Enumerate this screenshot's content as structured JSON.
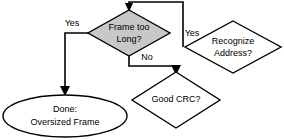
{
  "diagram": {
    "type": "flowchart",
    "canvas": {
      "width": 284,
      "height": 140,
      "background": "#ffffff"
    },
    "colors": {
      "stroke": "#000000",
      "fill_highlight": "#c8c8c8",
      "fill_plain": "#ffffff",
      "text": "#000000"
    },
    "nodes": [
      {
        "id": "frame-too-long",
        "shape": "decision",
        "label_lines": [
          "Frame too",
          "Long?"
        ],
        "fill": "#c8c8c8",
        "cx": 129,
        "cy": 33,
        "rx": 41,
        "ry": 23
      },
      {
        "id": "recognize-address",
        "shape": "decision",
        "label_lines": [
          "Recognize",
          "Address?"
        ],
        "fill": "#ffffff",
        "cx": 233,
        "cy": 47,
        "rx": 48,
        "ry": 26
      },
      {
        "id": "good-crc",
        "shape": "decision",
        "label_lines": [
          "Good CRC?"
        ],
        "fill": "#ffffff",
        "cx": 176,
        "cy": 100,
        "rx": 44,
        "ry": 28
      },
      {
        "id": "done-oversized-frame",
        "shape": "terminator",
        "label_lines": [
          "Done:",
          "Oversized Frame"
        ],
        "fill": "#ffffff",
        "cx": 65,
        "cy": 116,
        "rx": 62,
        "ry": 21
      }
    ],
    "edge_labels": [
      {
        "id": "yes-left",
        "text": "Yes",
        "x": 72,
        "y": 24
      },
      {
        "id": "yes-right",
        "text": "Yes",
        "x": 192,
        "y": 34
      },
      {
        "id": "no-down",
        "text": "No",
        "x": 147,
        "y": 58
      }
    ]
  }
}
